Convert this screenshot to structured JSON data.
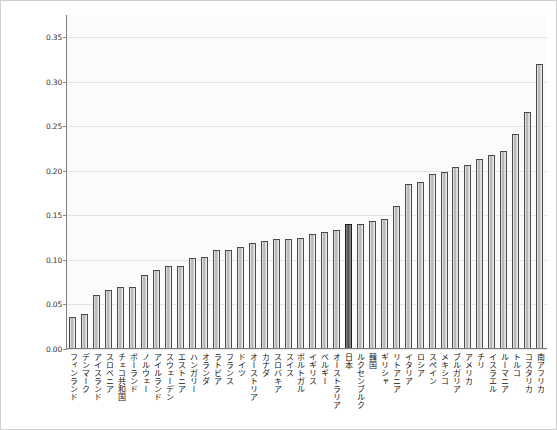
{
  "chart_data": {
    "type": "bar",
    "title": "",
    "subtitle": "",
    "xlabel": "",
    "ylabel": "",
    "ylim": [
      0.0,
      0.375
    ],
    "grid": true,
    "legend": null,
    "ytick_labels": [
      "0.00",
      "0.05",
      "0.10",
      "0.15",
      "0.20",
      "0.25",
      "0.30",
      "0.35"
    ],
    "ytick_values": [
      0.0,
      0.05,
      0.1,
      0.15,
      0.2,
      0.25,
      0.3,
      0.35
    ],
    "highlight_category": "日本",
    "highlight_color": "#5a5a5a",
    "bar_color": "#b8b8b8",
    "categories": [
      "フィンランド",
      "デンマーク",
      "アイスランド",
      "スロベニア",
      "チェコ共和国",
      "ポーランド",
      "ノルウェー",
      "アイルランド",
      "スウェーデン",
      "エストニア",
      "ハンガリー",
      "オランダ",
      "ラトビア",
      "フランス",
      "ドイツ",
      "オーストリア",
      "カナダ",
      "スロバキア",
      "スイス",
      "ポルトガル",
      "イギリス",
      "ベルギー",
      "オーストラリア",
      "日本",
      "ルクセンブルク",
      "韓国",
      "ギリシャ",
      "リトアニア",
      "イタリア",
      "ロシア",
      "スペイン",
      "メキシコ",
      "ブルガリア",
      "アメリカ",
      "チリ",
      "イスラエル",
      "ルーマニア",
      "トルコ",
      "コスタリカ",
      "南アフリカ"
    ],
    "values": [
      0.035,
      0.038,
      0.06,
      0.065,
      0.068,
      0.068,
      0.082,
      0.088,
      0.092,
      0.092,
      0.101,
      0.102,
      0.11,
      0.11,
      0.113,
      0.118,
      0.12,
      0.122,
      0.122,
      0.124,
      0.128,
      0.13,
      0.132,
      0.139,
      0.139,
      0.143,
      0.145,
      0.159,
      0.184,
      0.186,
      0.195,
      0.198,
      0.203,
      0.205,
      0.212,
      0.217,
      0.221,
      0.24,
      0.265,
      0.319
    ]
  }
}
